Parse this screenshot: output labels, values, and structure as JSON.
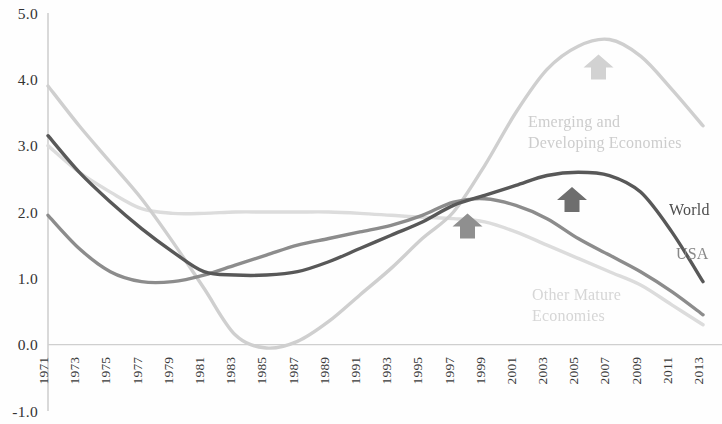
{
  "chart_data": {
    "type": "line",
    "title": "",
    "subtitle": "",
    "xlabel": "",
    "ylabel": "",
    "xlim": [
      1971,
      2013
    ],
    "ylim": [
      -1.0,
      5.0
    ],
    "grid": false,
    "legend_position": "inline-right",
    "y_ticks": [
      "5.0",
      "4.0",
      "3.0",
      "2.0",
      "1.0",
      "0.0",
      "-1.0"
    ],
    "y_tick_values": [
      5.0,
      4.0,
      3.0,
      2.0,
      1.0,
      0.0,
      -1.0
    ],
    "x_ticks": [
      "1971",
      "1973",
      "1975",
      "1977",
      "1979",
      "1981",
      "1983",
      "1985",
      "1987",
      "1989",
      "1991",
      "1993",
      "1995",
      "1997",
      "1999",
      "2001",
      "2003",
      "2005",
      "2007",
      "2009",
      "2011",
      "2013"
    ],
    "x_tick_values": [
      1971,
      1973,
      1975,
      1977,
      1979,
      1981,
      1983,
      1985,
      1987,
      1989,
      1991,
      1993,
      1995,
      1997,
      1999,
      2001,
      2003,
      2005,
      2007,
      2009,
      2011,
      2013
    ],
    "x": [
      1971,
      1973,
      1975,
      1977,
      1979,
      1981,
      1983,
      1985,
      1987,
      1989,
      1991,
      1993,
      1995,
      1997,
      1999,
      2001,
      2003,
      2005,
      2007,
      2009,
      2011,
      2013
    ],
    "series": [
      {
        "name": "Emerging and Developing Economies",
        "color": "#cfcfcf",
        "values": [
          3.9,
          3.3,
          2.75,
          2.2,
          1.55,
          0.85,
          0.15,
          -0.05,
          0.05,
          0.35,
          0.75,
          1.15,
          1.6,
          2.0,
          2.7,
          3.5,
          4.15,
          4.5,
          4.6,
          4.35,
          3.85,
          3.3
        ]
      },
      {
        "name": "World",
        "color": "#585858",
        "values": [
          3.15,
          2.6,
          2.15,
          1.75,
          1.4,
          1.1,
          1.05,
          1.05,
          1.1,
          1.25,
          1.45,
          1.65,
          1.85,
          2.1,
          2.25,
          2.4,
          2.55,
          2.6,
          2.55,
          2.3,
          1.7,
          0.95
        ]
      },
      {
        "name": "USA",
        "color": "#8c8c8c",
        "values": [
          1.95,
          1.45,
          1.1,
          0.95,
          0.95,
          1.05,
          1.2,
          1.35,
          1.5,
          1.6,
          1.7,
          1.8,
          1.95,
          2.15,
          2.2,
          2.1,
          1.9,
          1.6,
          1.35,
          1.1,
          0.8,
          0.45
        ]
      },
      {
        "name": "Other Mature Economies",
        "color": "#dcdcdc",
        "values": [
          3.0,
          2.6,
          2.3,
          2.05,
          1.98,
          1.98,
          2.0,
          2.0,
          2.0,
          2.0,
          1.98,
          1.95,
          1.92,
          1.9,
          1.85,
          1.7,
          1.5,
          1.3,
          1.1,
          0.9,
          0.6,
          0.3
        ]
      }
    ],
    "annotations": [
      {
        "id": "arrow-emerging",
        "icon": "up-arrow-icon",
        "color": "#d2d2d2",
        "x": 2006.3,
        "y": 4.18,
        "target_series": "Emerging and Developing Economies"
      },
      {
        "id": "arrow-world",
        "icon": "up-arrow-icon",
        "color": "#6e6e6e",
        "x": 2004.6,
        "y": 2.18,
        "target_series": "World"
      },
      {
        "id": "arrow-convergence",
        "icon": "up-arrow-icon",
        "color": "#8f8f8f",
        "x": 1997.9,
        "y": 1.78,
        "target_series": "USA"
      }
    ],
    "series_labels": [
      {
        "id": "label-emerging",
        "lines": [
          "Emerging and",
          "Developing Economies"
        ],
        "text": "Emerging and Developing Economies",
        "color": "#cdcdcd",
        "x_px": 528,
        "y_px": 127
      },
      {
        "id": "label-world",
        "lines": [
          "World"
        ],
        "text": "World",
        "color": "#4e4e4e",
        "x_px": 669,
        "y_px": 215
      },
      {
        "id": "label-usa",
        "lines": [
          "USA"
        ],
        "text": "USA",
        "color": "#888888",
        "x_px": 676,
        "y_px": 259
      },
      {
        "id": "label-other-mature",
        "lines": [
          "Other Mature",
          "Economies"
        ],
        "text": "Other Mature Economies",
        "color": "#d6d6d6",
        "x_px": 532,
        "y_px": 300
      }
    ]
  }
}
